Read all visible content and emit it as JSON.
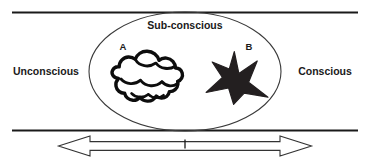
{
  "diagram": {
    "title_label": "Sub-conscious",
    "left_label": "Unconscious",
    "right_label": "Conscious",
    "marker_a": "A",
    "marker_b": "B",
    "colors": {
      "line": "#1a1a1a",
      "ellipse_stroke": "#3a3a3a",
      "star_fill": "#231f20",
      "cloud_stroke": "#0d0d0d",
      "text": "#1a1a1a",
      "background": "#ffffff",
      "arrow_fill": "#ffffff",
      "arrow_stroke": "#333333"
    },
    "shapes": {
      "ellipse_name": "sub-conscious-ellipse",
      "cloud_name": "cloud-shape-a",
      "star_name": "star-shape-b",
      "arrow_name": "double-headed-arrow",
      "top_rule_name": "top-boundary-line",
      "bottom_rule_name": "bottom-boundary-line",
      "center_tick_name": "arrow-center-tick"
    }
  }
}
